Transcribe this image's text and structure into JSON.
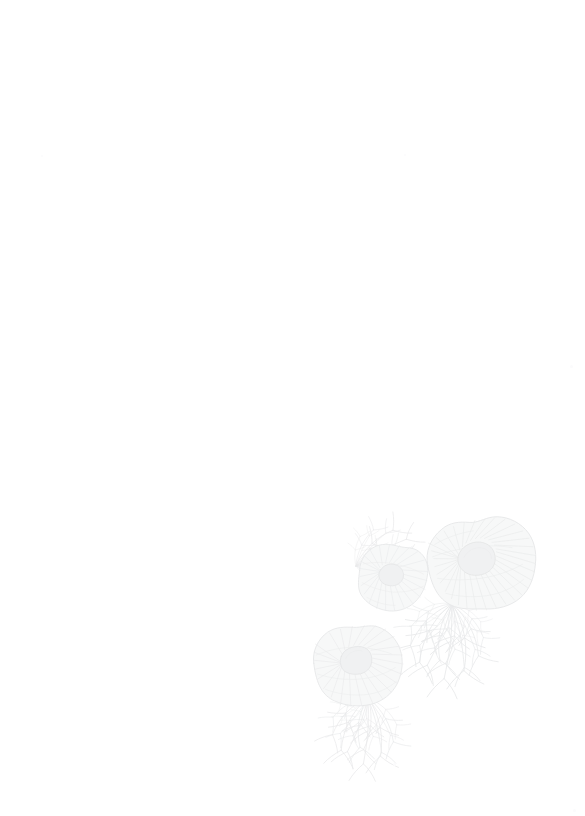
{
  "page": {
    "background_color": "#ffffff",
    "width_px": 585,
    "height_px": 816,
    "body_text": "",
    "orientation": "portrait"
  },
  "watermark": {
    "name": "botanical-fungus-watermark",
    "description": "Faint pale-grey botanical line illustration of three fungus caps with radial gills and branching mycelium roots",
    "subject": "mushroom-caps-with-mycelium",
    "position": "bottom-right",
    "stroke_color": "#e9eaeb",
    "fill_color": "#f6f7f7",
    "accent_color": "#f0f1f2",
    "opacity": "1",
    "bounds": {
      "x": 312,
      "y": 505,
      "width": 228,
      "height": 268
    },
    "elements": [
      {
        "name": "fungus-cap-large",
        "type": "cap",
        "cx": 482,
        "cy": 564,
        "rx": 55,
        "ry": 47,
        "rotation": -8,
        "ray_count": 56,
        "core": {
          "cx": 472,
          "cy": 558,
          "rx": 22,
          "ry": 15
        }
      },
      {
        "name": "fungus-cap-medium",
        "type": "cap",
        "cx": 393,
        "cy": 578,
        "rx": 35,
        "ry": 33,
        "rotation": 6,
        "ray_count": 46,
        "core": {
          "cx": 388,
          "cy": 574,
          "rx": 13,
          "ry": 9
        }
      },
      {
        "name": "fungus-cap-lower-left",
        "type": "cap",
        "cx": 360,
        "cy": 665,
        "rx": 47,
        "ry": 42,
        "rotation": -4,
        "ray_count": 52,
        "core": {
          "cx": 355,
          "cy": 662,
          "rx": 18,
          "ry": 13
        }
      },
      {
        "name": "mycelium-roots-upper-left",
        "type": "roots",
        "origin_x": 356,
        "origin_y": 566,
        "direction": "left",
        "spread": 44
      },
      {
        "name": "mycelium-roots-center",
        "type": "roots",
        "origin_x": 452,
        "origin_y": 606,
        "direction": "down",
        "spread": 62
      },
      {
        "name": "mycelium-roots-lower",
        "type": "roots",
        "origin_x": 368,
        "origin_y": 700,
        "direction": "down",
        "spread": 54
      }
    ]
  },
  "specks": [
    {
      "name": "speck-upper-left",
      "x": 41,
      "y": 155,
      "size": 2
    },
    {
      "name": "speck-upper-right",
      "x": 404,
      "y": 154,
      "size": 2
    },
    {
      "name": "speck-right-edge",
      "x": 570,
      "y": 365,
      "size": 3
    },
    {
      "name": "speck-bottom-right",
      "x": 393,
      "y": 763,
      "size": 3
    },
    {
      "name": "speck-bottom-corner",
      "x": 573,
      "y": 809,
      "size": 3
    }
  ]
}
